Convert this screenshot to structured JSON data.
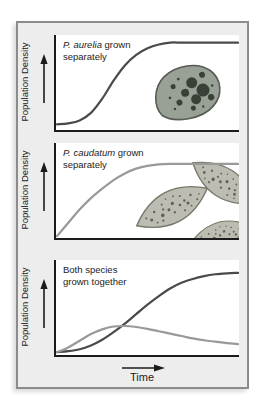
{
  "panels": [
    {
      "caption_italic": "P. aurelia",
      "caption_after": " grown",
      "caption_line2": "separately",
      "y_axis_label": "Population Density"
    },
    {
      "caption_italic": "P. caudatum",
      "caption_after": " grown",
      "caption_line2": "separately",
      "y_axis_label": "Population Density"
    },
    {
      "caption_italic": "",
      "caption_after": "Both species",
      "caption_line2": "grown together",
      "y_axis_label": "Population Density"
    }
  ],
  "x_axis_label": "Time",
  "icons": {
    "y_axis_arrow": "up-arrow",
    "x_axis_arrow": "right-arrow"
  },
  "colors": {
    "curve_aurelia": "#4a4a4a",
    "curve_caudatum": "#999999",
    "axis": "#1b1b1b",
    "frame_border": "#8c8c8c",
    "frame_bg": "#ededed",
    "plot_bg": "#ffffff",
    "text": "#1c1c1c",
    "cell_aurelia_fill": "#99a095",
    "cell_aurelia_outline": "#565c51",
    "cell_aurelia_spots": "#3a4037",
    "cell_caudatum_fill": "#bcbcb2",
    "cell_caudatum_outline": "#777769",
    "cell_caudatum_speckle": "#50503f"
  },
  "chart_data": [
    {
      "type": "line",
      "title": "P. aurelia grown separately",
      "xlabel": "Time",
      "ylabel": "Population Density",
      "axis_ticks": "none (qualitative diagram, arrows indicate increasing axes)",
      "x_evenly_spaced_0_to_1": true,
      "ylim": [
        0,
        1
      ],
      "series": [
        {
          "name": "P. aurelia",
          "color_key": "curve_aurelia",
          "y": [
            0.06,
            0.07,
            0.1,
            0.18,
            0.33,
            0.52,
            0.68,
            0.79,
            0.86,
            0.9,
            0.92,
            0.92,
            0.92,
            0.92,
            0.92,
            0.92,
            0.92
          ]
        }
      ]
    },
    {
      "type": "line",
      "title": "P. caudatum grown separately",
      "xlabel": "Time",
      "ylabel": "Population Density",
      "axis_ticks": "none (qualitative diagram, arrows indicate increasing axes)",
      "x_evenly_spaced_0_to_1": true,
      "ylim": [
        0,
        1
      ],
      "series": [
        {
          "name": "P. caudatum",
          "color_key": "curve_caudatum",
          "y": [
            0.02,
            0.16,
            0.3,
            0.42,
            0.52,
            0.61,
            0.68,
            0.73,
            0.76,
            0.775,
            0.78,
            0.78,
            0.78,
            0.78,
            0.78,
            0.78,
            0.78
          ]
        }
      ]
    },
    {
      "type": "line",
      "title": "Both species grown together",
      "xlabel": "Time",
      "ylabel": "Population Density",
      "axis_ticks": "none (qualitative diagram, arrows indicate increasing axes)",
      "x_evenly_spaced_0_to_1": true,
      "ylim": [
        0,
        1
      ],
      "series": [
        {
          "name": "P. aurelia",
          "color_key": "curve_aurelia",
          "y": [
            0.03,
            0.04,
            0.06,
            0.1,
            0.16,
            0.24,
            0.33,
            0.43,
            0.53,
            0.62,
            0.7,
            0.76,
            0.8,
            0.83,
            0.85,
            0.86,
            0.865
          ]
        },
        {
          "name": "P. caudatum",
          "color_key": "curve_caudatum",
          "y": [
            0.03,
            0.08,
            0.15,
            0.22,
            0.27,
            0.3,
            0.305,
            0.295,
            0.275,
            0.25,
            0.225,
            0.2,
            0.175,
            0.155,
            0.14,
            0.125,
            0.115
          ]
        }
      ]
    }
  ]
}
